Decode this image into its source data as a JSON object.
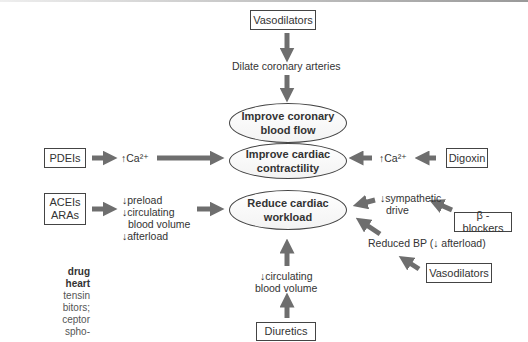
{
  "diagram": {
    "caption_fragment": {
      "line1": "drug",
      "line2": "heart",
      "line3": "tensin",
      "line4": "bitors;",
      "line5": "ceptor",
      "line6": "spho-"
    },
    "drugs": {
      "vasodilators_top": "Vasodilators",
      "pdeis": "PDEIs",
      "aceis": "ACEIs",
      "aras": "ARAs",
      "digoxin": "Digoxin",
      "beta_blockers": "β - blockers",
      "vasodilators_right": "Vasodilators",
      "diuretics": "Diuretics"
    },
    "effects": {
      "dilate": "Dilate coronary arteries",
      "ca_left": "↑Ca²⁺",
      "ca_right": "↑Ca²⁺",
      "preload": "↓preload",
      "circulating_left1": "↓circulating",
      "circulating_left2": "blood volume",
      "afterload": "↓afterload",
      "sympathetic1": "↓sympathetic",
      "sympathetic2": "drive",
      "reduced_bp": "Reduced BP (↓ afterload)",
      "circulating_bottom1": "↓circulating",
      "circulating_bottom2": "blood volume"
    },
    "outcomes": {
      "coronary1": "Improve coronary",
      "coronary2": "blood flow",
      "contractility1": "Improve cardiac",
      "contractility2": "contractility",
      "workload1": "Reduce cardiac",
      "workload2": "workload"
    },
    "colors": {
      "arrow": "#6e6e6e",
      "border": "#444444",
      "text": "#333333"
    }
  }
}
